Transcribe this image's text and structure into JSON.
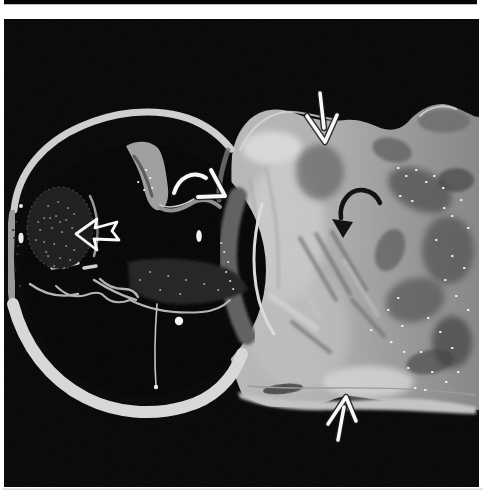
{
  "figure": {
    "alt": "Scanned grayscale gross-pathology photograph on white page: cross-sectioned specimen with dark circular lumen at left and pale gray tissue mass at right, annotated with three white straight/curved arrows, one open white arrow and one black curved arrow"
  },
  "colors": {
    "page_bg": "#ffffff",
    "photo_bg": "#050505",
    "lumen_black": "#030303",
    "arrow_white": "#fafafa",
    "arrow_black": "#0c0c0c",
    "arrow_outline": "#141414",
    "speck_white": "#f5f5f5",
    "rim_bright": "#d8d8d8",
    "tissue_light": "#bcbcbc",
    "tissue_mid": "#a0a0a0",
    "tissue_dark": "#868686",
    "tissue_highlight": "#d8d8d8"
  },
  "layout": {
    "photo_frame": "M4,19 H479 V487 H4 Z",
    "top_sliver": "M4,0 H477 V4.2 H4 Z",
    "bottom_hairline": "M2,488.6 H483 V489.8 H2 Z"
  },
  "specimen": {
    "tissue": {
      "silhouette": "M232,156 C234,140 242,124 254,116 C266,108 282,108 294,113 C312,120 330,122 346,120 C358,119 368,123 378,127 C390,132 400,130 408,122 C416,112 430,103 444,104 C454,105 464,112 470,114 C473,116 476,117 479,117 L479,410 C462,408 448,406 432,405 C410,403 390,401 372,399 C360,398 352,395 346,396 C338,397 330,401 320,404 C306,408 290,407 276,407 C264,407 252,401 242,394 C234,376 230,358 228,340 C227,318 228,296 231,274 C235,250 237,226 233,202 C231,186 231,170 232,156 Z",
      "top_ridge_highlight": "M242,148 a30,17 0 1 0 60,0 a30,17 0 1 0 -60,0 Z",
      "left_light_patch": "M245,230 a40,70 0 1 0 80,0 a40,70 0 1 0 -80,0 Z",
      "central_light_patch": "M250,330 a50,60 0 1 0 100,0 a50,60 0 1 0 -100,0 Z",
      "under_arrow_dark": "M296,172 a24,28 0 1 0 48,0 a24,28 0 1 0 -48,0 Z",
      "mound_shade": "M418,121 a26,12 0 1 0 52,0 a26,12 0 1 0 -52,0 Z",
      "mottle_1": "M386,190 a34,20 0 1 0 68,0 a34,20 0 1 0 -68,0 Z",
      "mottle_1_t": "rotate(25 420 190)",
      "mottle_2": "M422,250 a26,34 0 1 0 52,0 a26,34 0 1 0 -52,0 Z",
      "mottle_3": "M385,300 a30,22 0 1 0 60,0 a30,22 0 1 0 -60,0 Z",
      "mottle_3_t": "rotate(-15 415 300)",
      "mottle_4": "M432,342 a20,26 0 1 0 40,0 a20,26 0 1 0 -40,0 Z",
      "mottle_5": "M376,250 a14,22 0 1 0 28,0 a14,22 0 1 0 -28,0 Z",
      "mottle_5_t": "rotate(20 390 250)",
      "mottle_6": "M438,180 a18,12 0 1 0 36,0 a18,12 0 1 0 -36,0 Z",
      "mottle_7": "M406,362 a24,12 0 1 0 48,0 a24,12 0 1 0 -48,0 Z",
      "mottle_7_t": "rotate(-10 430 362)",
      "mottle_8": "M372,150 a20,12 0 1 0 40,0 a20,12 0 1 0 -40,0 Z",
      "mottle_8_t": "rotate(15 392 150)",
      "dark_streaks": "M300,238 L336,300 M316,234 L350,294 M332,232 L366,290 M292,322 L330,352 M352,300 L384,336",
      "light_streaks": "M286,260 L320,318 M344,260 L378,316",
      "vertical_folds": "M250,180 C258,220 260,260 256,300 M266,168 C276,208 280,248 278,288",
      "bright_streak": "M270,296 C286,306 302,318 316,328",
      "bottom_light_band": "M238,392 C280,404 330,402 380,399 C420,397 450,402 476,407 L476,414 C430,412 380,408 330,410 C290,411 260,406 240,398 Z",
      "bottom_bump_highlight": "M322,382 a46,16 0 1 0 92,0 a46,16 0 1 0 -92,0 Z",
      "fissure": "M263,389 a20,5 0 1 0 40,0 a20,5 0 1 0 -40,0 Z",
      "fissure_t": "rotate(-6 283 389)",
      "groove_line": "M248,386 C300,391 360,385 420,390 C442,391 460,393 475,395",
      "top_edge_highlight": "M240,150 C250,128 266,115 284,112 C300,110 316,117 332,119",
      "mound_highlight": "M420,116 C430,106 444,104 456,109",
      "glisten_specks": "M398,168h.5M406,176h.5M416,170h.5M426,182h.5M434,176h.5M443,188h.5M400,196h.5M412,201h.5M444,208h.5M452,216h.5M461,200h.5M468,228h.5M436,240h.5M452,256h.5M464,268h.5M445,280h.5M456,296h.5M468,310h.5M428,318h.5M440,332h.5M452,348h.5M421,352h.5M408,368h.5M432,372h.5M446,382h.5M458,372h.5M398,298h.5M388,310h.5M402,326h.5M391,342h.5M404,352h.5M371,330h.5M415,388h.5M425,390h.5"
    },
    "ring": {
      "lumen": "M22,270 a122,126 0 1 0 244,0 a122,126 0 1 0 -244,0 Z",
      "top_rim": "M14,210 C18,172 44,142 82,126 C114,112 150,108 180,116 C200,121 218,133 231,149",
      "left_rim": "M13,214 C9,242 9,272 13,302",
      "bottom_rim": "M13,304 C24,346 50,380 86,398 C116,413 152,416 184,407 C212,400 233,380 242,354",
      "right_dark_wall": "M238,196 C230,220 226,246 229,272 C231,296 238,318 247,336",
      "right_bright_edge": "M262,204 C254,232 252,260 256,286 C259,306 266,322 274,334",
      "junction_fold": "M228,150 C222,168 218,184 219,200",
      "rim_dark_dots": "M16,222h.4M14,238h.4M17,254h.4M15,270h.4M20,286h.4M13,230h.4M18,246h.4",
      "rim_top_dot": "M19,206 a2,2 0 1 0 4,0 a2,2 0 1 0 -4,0 Z"
    },
    "interior": {
      "seagull_body": "M126,146 C136,140 150,140 158,148 C164,156 166,172 168,188 C169,200 166,208 160,210 C152,212 146,200 144,188 C140,170 132,158 126,146 Z",
      "seagull_dark_streak": "M134,156 C142,166 148,182 152,196",
      "seagull_wing": "M160,208 C172,214 184,208 194,202 C202,198 212,200 220,207",
      "seagull_wing_highlight": "M160,205 C172,210 184,205 194,199",
      "seagull_specks": "M138,182h.4M144,190h.4M150,178h.4M146,170h.4M152,188h.4",
      "top_dark_band": "M128,262 C160,256 196,258 226,268 C236,272 244,280 248,290 C230,300 206,304 182,304 C160,304 142,298 130,288 Z",
      "band_specks": "M150,272h.4M168,276h.4M186,280h.4M204,284h.4M218,290h.4M160,290h.4M180,294h.4M140,280h.4",
      "wavy_line": "M56,286 Q70,300 86,295 Q99,290 104,296 Q114,306 130,300 C150,310 176,314 202,312 C214,311 224,306 230,300",
      "vertical_line": "M157,304 C155,330 154,358 156,386",
      "vertical_line_dot": "M153.8,387 a2.2,2.2 0 1 0 4.4,0 a2.2,2.2 0 1 0 -4.4,0 Z",
      "white_dot": "M174.8,321 a4.2,4.2 0 1 0 8.4,0 a4.2,4.2 0 1 0 -8.4,0 Z",
      "white_oval_right": "M196.2,236 a2.8,6 0 1 0 5.6,0 a2.8,6 0 1 0 -5.6,0 Z",
      "white_oval_left": "M18.4,238 a2.6,5.2 0 1 0 5.2,0 a2.6,5.2 0 1 0 -5.2,0 Z",
      "bright_slash": "M52,268 L78,263 M84,268 L96,266",
      "thrombus_mass": "M27,228 a33,41 0 1 0 66,0 a33,41 0 1 0 -66,0 Z",
      "thrombus_specks": "M48,206h.4M58,202h.4M68,208h.4M44,218h.4M56,216h.4M66,220h.4M74,214h.4M40,230h.4M52,228h.4M62,232h.4M72,228h.4M78,236h.4M44,242h.4M54,244h.4M66,246h.4M74,250h.4M48,256h.4M60,258h.4M70,260h.4M54,266h.4M64,268h.4M46,252h.4M36,240h.4M38,222h.4M50,218h.4M60,222h.4",
      "mass_highlight_arc": "M90,196 C98,212 100,236 94,256",
      "lower_scallops": "M30,284 Q52,300 78,294 M94,280 Q116,294 136,300 M100,279 q10,10 24,10 q10,0 14,8",
      "inner_edge_specks": "M224,252h.4M228,262h.4M226,272h.4M230,281h.4M233,289h.4M221,243h.4"
    }
  },
  "annotations": {
    "white_curved_arrow": {
      "curve": "M174,193 C179,177 193,170 206,178",
      "head": "M211,170 L225,196 L198,197"
    },
    "white_open_arrow": {
      "points": "76,234 97,219 95,228 117,222 112,231 119,240 94,239 97,250"
    },
    "white_down_arrow": {
      "shaft": "M320,93 L324,128",
      "head": "M307,116 L325,142 L337,115"
    },
    "black_curved_arrow": {
      "curve": "M380,203 C374,189 356,185 346,198 C342,203 340,210 341,218",
      "head": "343,238 332,219 353,222"
    },
    "white_up_arrow": {
      "shaft": "M338,440 L344,407",
      "head": "M328,424 L346,397 L356,421"
    }
  }
}
